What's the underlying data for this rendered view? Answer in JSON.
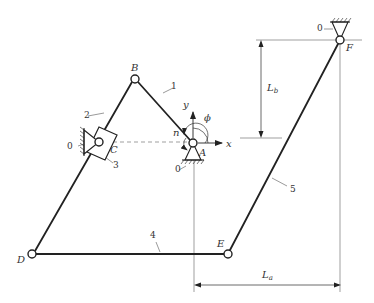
{
  "diagram": {
    "type": "planar-linkage-mechanism",
    "colors": {
      "link": "#222222",
      "thin": "#555555",
      "dashed": "#666666",
      "background": "#ffffff"
    },
    "points": {
      "A": {
        "label": "A",
        "x": 193,
        "y": 143
      },
      "B": {
        "label": "B",
        "x": 135,
        "y": 79
      },
      "C": {
        "label": "C",
        "x": 99,
        "y": 142
      },
      "D": {
        "label": "D",
        "x": 32,
        "y": 254
      },
      "E": {
        "label": "E",
        "x": 228,
        "y": 254
      },
      "F": {
        "label": "F",
        "x": 340,
        "y": 40
      }
    },
    "links": [
      {
        "id": "1",
        "from": "A",
        "to": "B"
      },
      {
        "id": "2",
        "from": "B",
        "to": "C"
      },
      {
        "id": "3",
        "description": "slider block on link 2 pivoting at C"
      },
      {
        "id": "4",
        "from": "D",
        "to": "E"
      },
      {
        "id": "5",
        "from": "E",
        "to": "F"
      }
    ],
    "ground_labels": {
      "A": "0",
      "C": "0",
      "F": "0"
    },
    "axes": {
      "x_label": "x",
      "y_label": "y"
    },
    "angle_label": "ϕ",
    "speed_label": "n",
    "dimensions": {
      "La": {
        "main": "L",
        "sub": "a"
      },
      "Lb": {
        "main": "L",
        "sub": "b"
      }
    }
  }
}
